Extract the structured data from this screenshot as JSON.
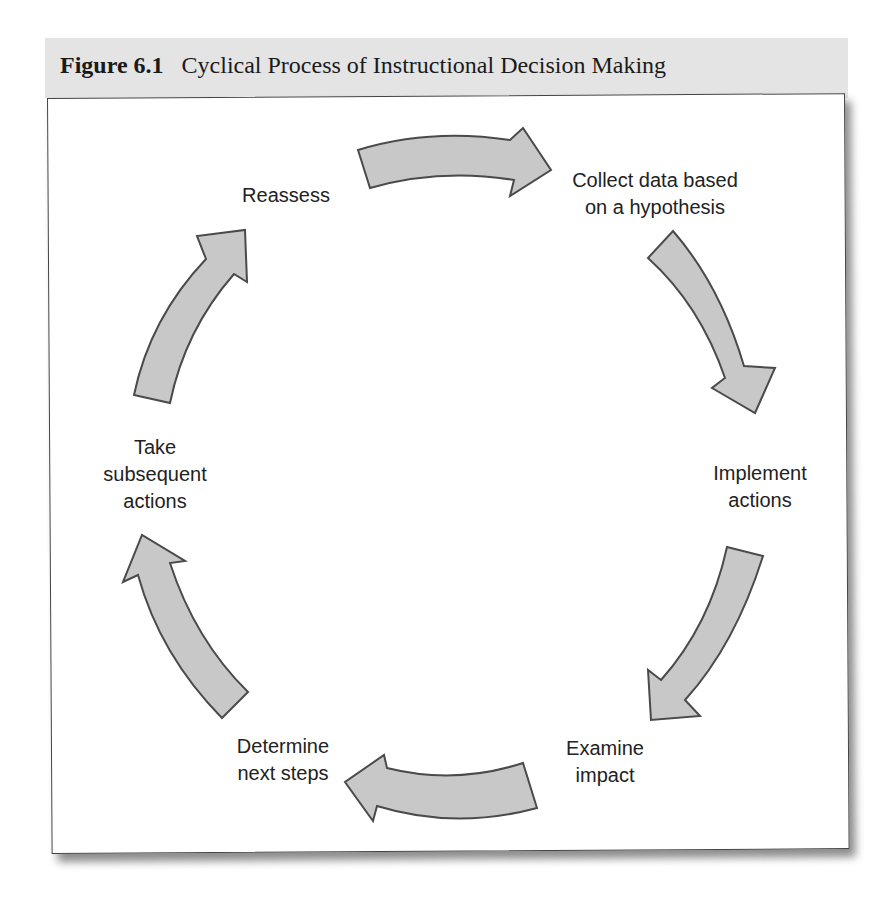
{
  "figure": {
    "number": "Figure 6.1",
    "title": "Cyclical Process of Instructional Decision Making"
  },
  "colors": {
    "arrow_fill": "#c8c8c8",
    "arrow_stroke": "#4a4a4a",
    "caption_band": "#e4e4e4"
  },
  "steps": [
    {
      "id": "collect",
      "lines": [
        "Collect data based",
        "on a hypothesis"
      ]
    },
    {
      "id": "implement",
      "lines": [
        "Implement",
        "actions"
      ]
    },
    {
      "id": "examine",
      "lines": [
        "Examine",
        "impact"
      ]
    },
    {
      "id": "determine",
      "lines": [
        "Determine",
        "next steps"
      ]
    },
    {
      "id": "take",
      "lines": [
        "Take",
        "subsequent",
        "actions"
      ]
    },
    {
      "id": "reassess",
      "lines": [
        "Reassess"
      ]
    }
  ],
  "arrows": [
    {
      "from": "reassess",
      "to": "collect",
      "icon": "curved-arrow-right-icon"
    },
    {
      "from": "collect",
      "to": "implement",
      "icon": "curved-arrow-down-icon"
    },
    {
      "from": "implement",
      "to": "examine",
      "icon": "curved-arrow-down-left-icon"
    },
    {
      "from": "examine",
      "to": "determine",
      "icon": "curved-arrow-left-icon"
    },
    {
      "from": "determine",
      "to": "take",
      "icon": "curved-arrow-up-icon"
    },
    {
      "from": "take",
      "to": "reassess",
      "icon": "curved-arrow-up-right-icon"
    }
  ]
}
